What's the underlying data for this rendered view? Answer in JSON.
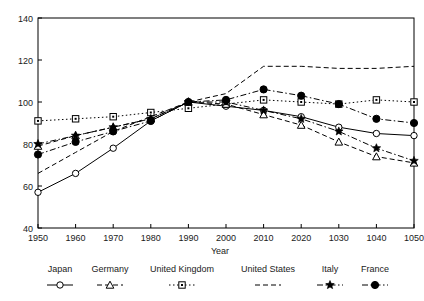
{
  "chart_data": {
    "type": "line",
    "title": "",
    "xlabel": "Year",
    "ylabel": "",
    "xlim": [
      1950,
      2050
    ],
    "ylim": [
      40,
      140
    ],
    "grid": false,
    "legend_position": "bottom",
    "x": [
      1950,
      1960,
      1970,
      1980,
      1990,
      2000,
      2010,
      2020,
      2030,
      2040,
      2050
    ],
    "xticklabels": [
      "1950",
      "1960",
      "1970",
      "1980",
      "1990",
      "2000",
      "2010",
      "1030",
      "1040",
      "1050"
    ],
    "xtickvalues": [
      1950,
      1960,
      1970,
      1980,
      1990,
      2000,
      2010,
      2020,
      2030,
      2040,
      2050
    ],
    "xtick_display": [
      "1950",
      "1960",
      "1970",
      "1980",
      "1990",
      "2000",
      "2010",
      "2020",
      "1030",
      "1040",
      "1050"
    ],
    "yticklabels": [
      "40",
      "60",
      "80",
      "100",
      "120",
      "140"
    ],
    "ytickvalues": [
      40,
      60,
      80,
      100,
      120,
      140
    ],
    "series": [
      {
        "name": "Japan",
        "marker": "open-circle",
        "dash": "solid",
        "values": [
          57,
          66,
          78,
          91,
          100,
          98,
          96,
          93,
          88,
          85,
          84
        ]
      },
      {
        "name": "Germany",
        "marker": "open-triangle",
        "dash": "dashed",
        "values": [
          79,
          84,
          88,
          92,
          100,
          99,
          94,
          89,
          81,
          74,
          71
        ]
      },
      {
        "name": "United Kingdom",
        "marker": "open-square",
        "dash": "dotted",
        "values": [
          91,
          92,
          93,
          95,
          97,
          99,
          101,
          100,
          99,
          101,
          100
        ]
      },
      {
        "name": "United States",
        "marker": "none",
        "dash": "dashed",
        "values": [
          66,
          76,
          86,
          93,
          100,
          104,
          117,
          117,
          116,
          116,
          117
        ]
      },
      {
        "name": "Italy",
        "marker": "filled-star",
        "dash": "dash-dot",
        "values": [
          80,
          84,
          88,
          92,
          100,
          100,
          96,
          92,
          86,
          78,
          72
        ]
      },
      {
        "name": "France",
        "marker": "filled-circle",
        "dash": "dash-dot",
        "values": [
          75,
          81,
          86,
          91,
          100,
          101,
          106,
          103,
          99,
          92,
          90
        ]
      }
    ],
    "colors": {
      "axis": "#000000",
      "series": "#000000",
      "background": "#ffffff"
    }
  },
  "legend": {
    "entries": [
      {
        "label": "Japan"
      },
      {
        "label": "Germany"
      },
      {
        "label": "United Kingdom"
      },
      {
        "label": "United States"
      },
      {
        "label": "Italy"
      },
      {
        "label": "France"
      }
    ]
  }
}
